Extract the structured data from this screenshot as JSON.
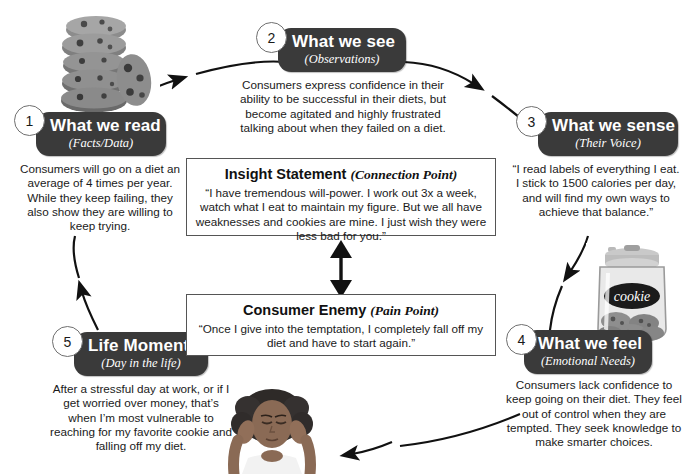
{
  "diagram": {
    "accent_dark": "#3a3a3a",
    "line_color": "#111111",
    "background": "#ffffff"
  },
  "stages": [
    {
      "number": "1",
      "title": "What we read",
      "subtitle": "(Facts/Data)",
      "body": "Consumers will go on a diet an average of 4 times per year. While they keep failing, they also show they are willing to keep trying.",
      "icon": "cookie-stack-photo"
    },
    {
      "number": "2",
      "title": "What we see",
      "subtitle": "(Observations)",
      "body": "Consumers express confidence in their ability to be successful in their diets, but become agitated and highly frustrated talking about when they failed on a diet.",
      "icon": null
    },
    {
      "number": "3",
      "title": "What we sense",
      "subtitle": "(Their Voice)",
      "body": "“I read labels of everything I eat. I stick to 1500 calories per day, and will find my own ways to achieve that balance.”",
      "icon": null
    },
    {
      "number": "4",
      "title": "What we feel",
      "subtitle": "(Emotional Needs)",
      "body": "Consumers lack confidence to keep going on their diet. They feel out of control when they are tempted. They seek knowledge to make smarter choices.",
      "icon": "cookie-jar-photo"
    },
    {
      "number": "5",
      "title": "Life Moments",
      "subtitle": "(Day in the life)",
      "body": "After a stressful day at work, or if I get worried over money, that’s when I’m most vulnerable to reaching for my favorite cookie and falling off my diet.",
      "icon": "stressed-woman-photo"
    }
  ],
  "center": {
    "insight": {
      "heading": "Insight Statement",
      "heading_note": "(Connection Point)",
      "body": "“I have tremendous will-power. I work out 3x a week, watch what I eat to maintain my figure. But we all have weaknesses and cookies are mine. I just wish they were less bad for you.”"
    },
    "enemy": {
      "heading": "Consumer Enemy",
      "heading_note": "(Pain Point)",
      "body": "“Once I give into the temptation, I completely fall off my diet and have to start again.”"
    }
  },
  "photos": {
    "cookie_stack_label": "stack of chocolate chip cookies",
    "cookie_jar_label": "cookie",
    "woman_label": "woman holding her head, stressed"
  }
}
